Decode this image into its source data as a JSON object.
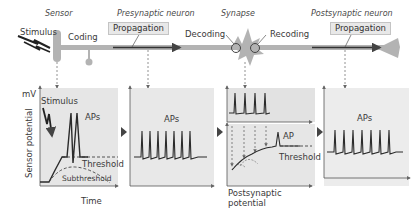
{
  "header": {
    "sensor": "Sensor",
    "presynaptic": "Presynaptic neuron",
    "synapse": "Synapse",
    "postsynaptic": "Postsynaptic neuron"
  },
  "top_labels": {
    "stimulus": "Stimulus",
    "coding": "Coding",
    "propagation_pre": "Propagation",
    "decoding": "Decoding",
    "recoding": "Recoding",
    "propagation_post": "Propagation"
  },
  "panel1": {
    "y_unit": "mV",
    "y_axis": "Sensor potential",
    "x_axis": "Time",
    "stimulus": "Stimulus",
    "aps": "APs",
    "threshold": "Threshold",
    "subthreshold": "Subthreshold"
  },
  "panel2": {
    "aps": "APs"
  },
  "panel3": {
    "ap": "AP",
    "threshold": "Threshold",
    "caption_line1": "Postsynaptic",
    "caption_line2": "potential"
  },
  "panel4": {
    "aps": "APs"
  },
  "colors": {
    "panel_bg": "#e6e6e6",
    "panel_bg_light": "#efefef",
    "neuron": "#b3b3b3",
    "trace": "#2b2b2b",
    "axis": "#555555",
    "arrowhead": "#444444"
  }
}
